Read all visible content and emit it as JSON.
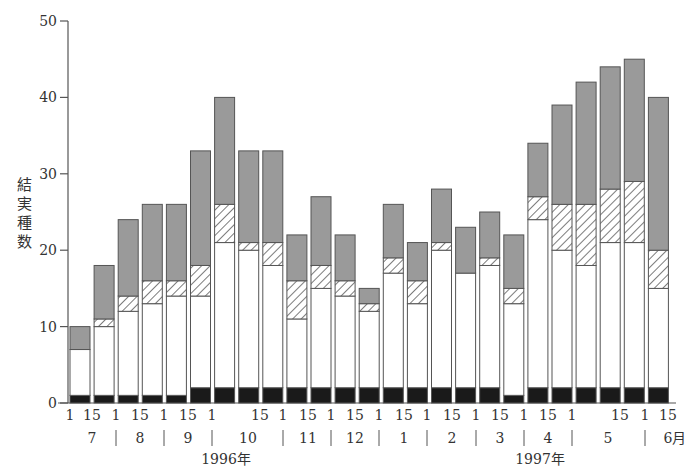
{
  "chart_data": {
    "type": "bar",
    "stacked": true,
    "title": "",
    "xlabel": "",
    "ylabel": "結実種数",
    "ylim": [
      0,
      50
    ],
    "yticks": [
      0,
      10,
      20,
      30,
      40,
      50
    ],
    "grid": false,
    "legend": null,
    "categories": [
      "1996-07-01",
      "1996-07-15",
      "1996-08-01",
      "1996-08-15",
      "1996-09-01",
      "1996-09-15",
      "1996-10-01",
      "1996-10-08",
      "1996-10-15",
      "1996-11-01",
      "1996-11-15",
      "1996-12-01",
      "1996-12-15",
      "1997-01-01",
      "1997-01-15",
      "1997-02-01",
      "1997-02-15",
      "1997-03-01",
      "1997-03-15",
      "1997-04-01",
      "1997-04-15",
      "1997-05-01",
      "1997-05-08",
      "1997-05-15",
      "1997-06-01"
    ],
    "series": [
      {
        "name": "black",
        "fill": "#1a1a1a",
        "values": [
          1,
          1,
          1,
          1,
          1,
          2,
          2,
          2,
          2,
          2,
          2,
          2,
          2,
          2,
          2,
          2,
          2,
          2,
          1,
          2,
          2,
          2,
          2,
          2,
          2
        ]
      },
      {
        "name": "white",
        "fill": "#ffffff",
        "values": [
          6,
          9,
          11,
          12,
          13,
          12,
          19,
          18,
          16,
          9,
          13,
          12,
          10,
          15,
          11,
          18,
          15,
          16,
          12,
          22,
          18,
          16,
          19,
          19,
          13
        ]
      },
      {
        "name": "hatched",
        "fill": "hatch",
        "values": [
          0,
          1,
          2,
          3,
          2,
          4,
          5,
          1,
          3,
          5,
          3,
          2,
          1,
          2,
          3,
          1,
          0,
          1,
          2,
          3,
          6,
          8,
          7,
          8,
          5
        ]
      },
      {
        "name": "gray",
        "fill": "#9a9a9a",
        "values": [
          3,
          7,
          10,
          10,
          10,
          15,
          14,
          12,
          12,
          6,
          9,
          6,
          2,
          7,
          5,
          7,
          6,
          6,
          7,
          7,
          13,
          16,
          16,
          16,
          20
        ]
      }
    ],
    "totals": [
      10,
      18,
      24,
      26,
      26,
      33,
      40,
      33,
      33,
      22,
      27,
      22,
      15,
      26,
      21,
      28,
      23,
      25,
      22,
      34,
      39,
      42,
      44,
      45,
      40
    ],
    "x_tick_labels": [
      {
        "text": "1",
        "x": 70
      },
      {
        "text": "15",
        "x": 92
      },
      {
        "text": "1",
        "x": 116
      },
      {
        "text": "15",
        "x": 140
      },
      {
        "text": "1",
        "x": 164
      },
      {
        "text": "15",
        "x": 188
      },
      {
        "text": "1",
        "x": 212
      },
      {
        "text": "15",
        "x": 260
      },
      {
        "text": "1",
        "x": 283
      },
      {
        "text": "15",
        "x": 308
      },
      {
        "text": "1",
        "x": 331
      },
      {
        "text": "15",
        "x": 355
      },
      {
        "text": "1",
        "x": 379
      },
      {
        "text": "15",
        "x": 404
      },
      {
        "text": "1",
        "x": 427
      },
      {
        "text": "15",
        "x": 452
      },
      {
        "text": "1",
        "x": 476
      },
      {
        "text": "15",
        "x": 500
      },
      {
        "text": "1",
        "x": 524
      },
      {
        "text": "15",
        "x": 548
      },
      {
        "text": "1",
        "x": 572
      },
      {
        "text": "15",
        "x": 620
      },
      {
        "text": "1",
        "x": 645
      },
      {
        "text": "15",
        "x": 668
      }
    ],
    "month_labels": [
      {
        "text": "7",
        "x": 92
      },
      {
        "text": "8",
        "x": 140
      },
      {
        "text": "9",
        "x": 188
      },
      {
        "text": "10",
        "x": 248
      },
      {
        "text": "11",
        "x": 308
      },
      {
        "text": "12",
        "x": 355
      },
      {
        "text": "1",
        "x": 404
      },
      {
        "text": "2",
        "x": 452
      },
      {
        "text": "3",
        "x": 500
      },
      {
        "text": "4",
        "x": 548
      },
      {
        "text": "5",
        "x": 608
      },
      {
        "text": "6月",
        "x": 675
      }
    ],
    "month_separators": [
      116,
      164,
      212,
      283,
      331,
      379,
      427,
      476,
      524,
      572,
      645
    ],
    "year_labels": [
      {
        "text": "1996年",
        "x": 226
      },
      {
        "text": "1997年",
        "x": 540
      }
    ]
  }
}
